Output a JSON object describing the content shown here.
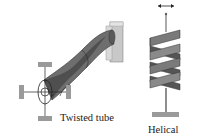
{
  "diagram": {
    "twisted_tube": {
      "label": "Twisted tube",
      "components": [
        "mounting-block",
        "twisted-tube",
        "crosshair-fixture",
        "pad-left",
        "pad-right",
        "pad-top",
        "pad-bottom"
      ]
    },
    "helical": {
      "label": "Helical",
      "components": [
        "double-arrow",
        "top-rod",
        "helical-band",
        "bottom-rod",
        "base-plate"
      ]
    },
    "colors": {
      "tube_fill": "#6e6e6e",
      "tube_dark": "#4a4a4a",
      "block_fill": "#c8c8c8",
      "pad_fill": "#9a9a9a",
      "line": "#222222",
      "background": "#ffffff"
    }
  }
}
